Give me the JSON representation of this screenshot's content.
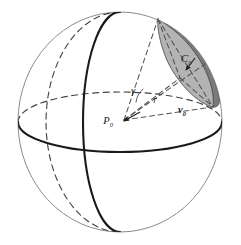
{
  "figure": {
    "type": "geometry-diagram",
    "background_color": "#ffffff"
  },
  "labels": {
    "cap": {
      "symbol": "C",
      "subscript": "0",
      "full": "C₀",
      "x": 186,
      "y": 62
    },
    "angle": {
      "symbol": "γ",
      "full": "γ",
      "x": 133,
      "y": 94
    },
    "radius": {
      "symbol": "r",
      "full": "r",
      "x": 155,
      "y": 103
    },
    "center_point": {
      "symbol": "P",
      "subscript": "0",
      "full": "P₀",
      "x": 108,
      "y": 124
    },
    "axis_vector": {
      "symbol": "v",
      "subscript": "0",
      "full": "v₀",
      "x": 182,
      "y": 113
    }
  },
  "colors": {
    "cap_outer_shade": "#7a7a7a",
    "cap_inner_shade": "#b3b3b3",
    "cap_edge": "#555555",
    "sphere_outline": "#8c8c8c",
    "great_circle_solid": "#1a1a1a",
    "great_circle_dashed": "#444444",
    "construction_dashed": "#555555",
    "label_color": "#1a1a1a"
  },
  "geometry": {
    "sphere": {
      "cx": 120,
      "cy": 122,
      "rx": 102,
      "ry": 110
    },
    "equator": {
      "cx": 120,
      "cy": 122,
      "rx": 102,
      "ry": 30
    },
    "meridian_front": {
      "cx": 120,
      "cy": 122,
      "rx": 37,
      "ry": 110
    },
    "meridian_back": {
      "cx": 120,
      "cy": 122,
      "rx": 74,
      "ry": 110
    },
    "cap_center_on_sphere": {
      "x": 205,
      "y": 64
    },
    "cap_tip_upper": {
      "x": 158,
      "y": 19
    },
    "cap_tip_lower": {
      "x": 213,
      "y": 107
    }
  },
  "elements": {
    "sphere_name": "sphere-outline",
    "cap_name": "spherical-cap-region",
    "cone_name": "cone-construction-lines"
  }
}
